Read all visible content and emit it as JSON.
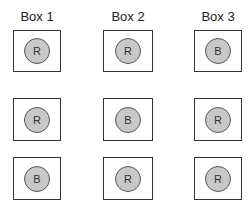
{
  "columns": [
    {
      "label": "Box 1"
    },
    {
      "label": "Box 2"
    },
    {
      "label": "Box 3"
    }
  ],
  "rows": [
    {
      "balls": [
        "R",
        "R",
        "B"
      ]
    },
    {
      "balls": [
        "R",
        "B",
        "R"
      ]
    },
    {
      "balls": [
        "B",
        "R",
        "R"
      ]
    }
  ],
  "colors": {
    "ball_fill": "#c8c8c8",
    "outline": "#333333"
  }
}
